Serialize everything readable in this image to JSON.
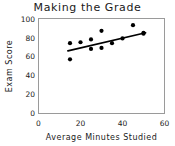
{
  "chart_data": {
    "type": "scatter",
    "title": "Making  the  Grade",
    "xlabel": "Average  Minutes  Studied",
    "ylabel": "Exam  Score",
    "xlim": [
      0,
      60
    ],
    "ylim": [
      0,
      100
    ],
    "xticks": [
      0,
      20,
      40,
      60
    ],
    "yticks": [
      0,
      20,
      40,
      60,
      80,
      100
    ],
    "grid": false,
    "legend": "none",
    "marker": "filled-circle",
    "marker_color": "#000000",
    "x": [
      15,
      15,
      20,
      25,
      25,
      30,
      30,
      35,
      40,
      45,
      50,
      50
    ],
    "y": [
      74,
      57,
      75,
      78,
      68,
      87,
      69,
      74,
      79,
      93,
      85,
      84
    ],
    "points": [
      {
        "x": 15,
        "y": 74
      },
      {
        "x": 15,
        "y": 57
      },
      {
        "x": 20,
        "y": 75
      },
      {
        "x": 25,
        "y": 78
      },
      {
        "x": 25,
        "y": 68
      },
      {
        "x": 30,
        "y": 87
      },
      {
        "x": 30,
        "y": 69
      },
      {
        "x": 35,
        "y": 74
      },
      {
        "x": 40,
        "y": 79
      },
      {
        "x": 45,
        "y": 93
      },
      {
        "x": 50,
        "y": 85
      },
      {
        "x": 50,
        "y": 84
      }
    ],
    "trendline": {
      "type": "linear-fit",
      "x_start": 14,
      "y_start": 66,
      "x_end": 51,
      "y_end": 85,
      "color": "#000000"
    }
  },
  "colors": {
    "background": "#ffffff",
    "frame": "#9a9a9a",
    "text": "#1a1a1a",
    "marker": "#000000"
  }
}
